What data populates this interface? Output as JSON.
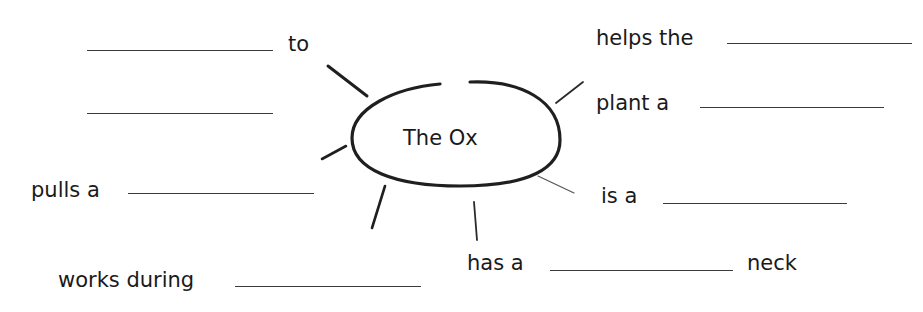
{
  "center": {
    "label": "The Ox"
  },
  "items": {
    "to": {
      "before": "",
      "after": "to"
    },
    "blank2": {
      "before": "",
      "after": ""
    },
    "pulls": {
      "before": "pulls a",
      "after": ""
    },
    "works": {
      "before": "works during",
      "after": ""
    },
    "helps": {
      "before": "helps the",
      "after": ""
    },
    "plant": {
      "before": "plant a",
      "after": ""
    },
    "is": {
      "before": "is a",
      "after": ""
    },
    "has": {
      "before": "has a",
      "after": "neck"
    }
  },
  "colors": {
    "ink": "#1a1a1a",
    "line": "#3a3a3a"
  }
}
